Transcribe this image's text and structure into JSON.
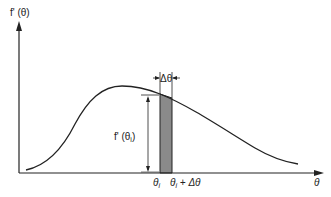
{
  "diagram": {
    "y_axis_label": "f' (θ)",
    "x_axis_label": "θ",
    "height_label": "f' (θ",
    "height_label_sub": "i",
    "height_label_close": ")",
    "delta_label": "Δθ",
    "tick_left_label": "θ",
    "tick_left_sub": "i",
    "tick_right_label": "θ",
    "tick_right_sub": "i",
    "tick_right_suffix": " + Δθ",
    "colors": {
      "line": "#222222",
      "shade": "#8a8a8a",
      "background": "#ffffff"
    }
  }
}
